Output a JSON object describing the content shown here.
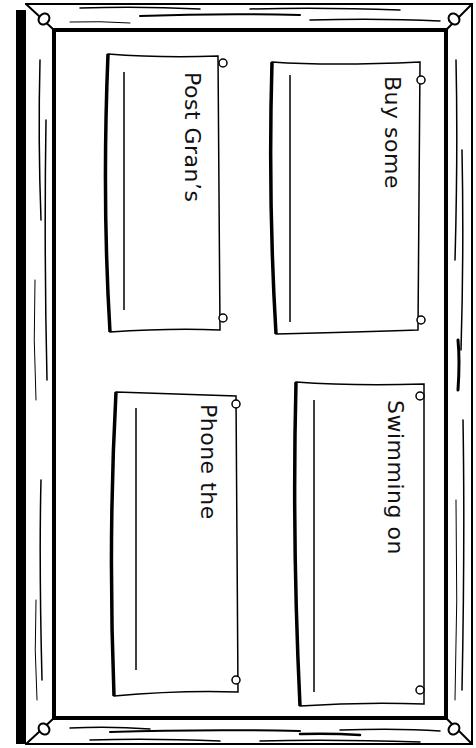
{
  "worksheet": {
    "board": "notice-board",
    "notes": [
      {
        "id": "buy",
        "text": "Buy some"
      },
      {
        "id": "post",
        "text": "Post Gran’s"
      },
      {
        "id": "swim",
        "text": "Swimming on"
      },
      {
        "id": "phone",
        "text": "Phone the"
      }
    ]
  }
}
